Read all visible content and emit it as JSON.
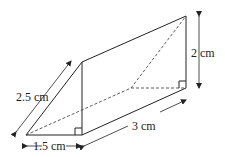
{
  "diagram": {
    "type": "triangular-prism",
    "labels": {
      "slant": "2.5 cm",
      "base": "1.5 cm",
      "length": "3 cm",
      "height": "2 cm"
    },
    "right_angle_markers": 2,
    "colors": {
      "line": "#222222",
      "background": "#ffffff"
    }
  }
}
